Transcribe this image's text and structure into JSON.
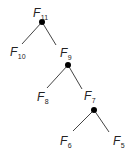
{
  "diagram": {
    "type": "binary-tree",
    "colors": {
      "line": "#444444",
      "node": "#000000",
      "text": "#222222"
    },
    "nodes": [
      {
        "id": "F11",
        "base": "F",
        "sub": "11",
        "lx": 33,
        "ly": 17,
        "dot": [
          42,
          22
        ]
      },
      {
        "id": "F10",
        "base": "F",
        "sub": "10",
        "lx": 10,
        "ly": 56
      },
      {
        "id": "F9",
        "base": "F",
        "sub": "9",
        "lx": 60,
        "ly": 57,
        "dot": [
          68,
          65
        ]
      },
      {
        "id": "F8",
        "base": "F",
        "sub": "8",
        "lx": 37,
        "ly": 101
      },
      {
        "id": "F7",
        "base": "F",
        "sub": "7",
        "lx": 84,
        "ly": 100,
        "dot": [
          94,
          110
        ]
      },
      {
        "id": "F6",
        "base": "F",
        "sub": "6",
        "lx": 60,
        "ly": 145
      },
      {
        "id": "F5",
        "base": "F",
        "sub": "5",
        "lx": 113,
        "ly": 145
      }
    ],
    "edges": [
      {
        "from": "F11",
        "to": "F10",
        "x1": 42,
        "y1": 22,
        "x2": 22,
        "y2": 44
      },
      {
        "from": "F11",
        "to": "F9",
        "x1": 42,
        "y1": 22,
        "x2": 56,
        "y2": 45
      },
      {
        "from": "F9",
        "to": "F8",
        "x1": 68,
        "y1": 65,
        "x2": 47,
        "y2": 88
      },
      {
        "from": "F9",
        "to": "F7",
        "x1": 68,
        "y1": 65,
        "x2": 82,
        "y2": 89
      },
      {
        "from": "F7",
        "to": "F6",
        "x1": 94,
        "y1": 110,
        "x2": 73,
        "y2": 131
      },
      {
        "from": "F7",
        "to": "F5",
        "x1": 94,
        "y1": 110,
        "x2": 109,
        "y2": 132
      }
    ]
  }
}
